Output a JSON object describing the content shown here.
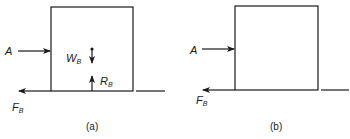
{
  "panels": [
    {
      "caption": "(a)",
      "labels": {
        "applied_force": "A",
        "weight": "W",
        "weight_sub": "B",
        "reaction": "R",
        "reaction_sub": "B",
        "friction": "F",
        "friction_sub": "B"
      }
    },
    {
      "caption": "(b)",
      "labels": {
        "applied_force": "A",
        "friction": "F",
        "friction_sub": "B"
      }
    }
  ],
  "colors": {
    "stroke": "#1a1a1a",
    "background": "#ffffff"
  }
}
